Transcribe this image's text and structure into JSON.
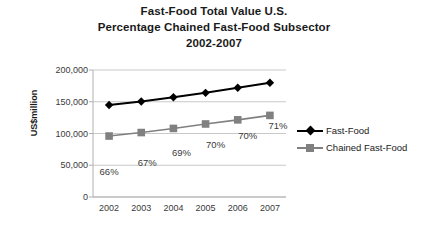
{
  "chart_data": {
    "type": "line",
    "title": "Fast-Food Total Value U.S. Percentage Chained Fast-Food Subsector 2002-2007",
    "title_lines": [
      "Fast-Food Total Value U.S.",
      "Percentage Chained Fast-Food Subsector",
      "2002-2007"
    ],
    "xlabel": "",
    "ylabel": "US$million",
    "categories": [
      "2002",
      "2003",
      "2004",
      "2005",
      "2006",
      "2007"
    ],
    "ylim": [
      0,
      200000
    ],
    "yticks": [
      0,
      50000,
      100000,
      150000,
      200000
    ],
    "ytick_labels": [
      "0",
      "50,000",
      "100,000",
      "150,000",
      "200,000"
    ],
    "grid": true,
    "legend_position": "right",
    "series": [
      {
        "name": "Fast-Food",
        "color": "#000000",
        "marker": "diamond",
        "values": [
          145000,
          150500,
          157000,
          164000,
          172000,
          180000
        ]
      },
      {
        "name": "Chained Fast-Food",
        "color": "#808080",
        "marker": "square",
        "values": [
          96000,
          101500,
          108000,
          115000,
          121500,
          128500
        ]
      }
    ],
    "annotations": [
      {
        "category": "2002",
        "text": "66%"
      },
      {
        "category": "2003",
        "text": "67%"
      },
      {
        "category": "2004",
        "text": "69%"
      },
      {
        "category": "2005",
        "text": "70%"
      },
      {
        "category": "2006",
        "text": "70%"
      },
      {
        "category": "2007",
        "text": "71%"
      }
    ],
    "annotation_offsets": [
      {
        "dx": 0,
        "dy": 30
      },
      {
        "dx": 6,
        "dy": 24
      },
      {
        "dx": 8,
        "dy": 19
      },
      {
        "dx": 10,
        "dy": 15
      },
      {
        "dx": 10,
        "dy": 10
      },
      {
        "dx": 8,
        "dy": 5
      }
    ],
    "colors": {
      "series_primary": "#000000",
      "series_secondary": "#808080",
      "gridline": "#c9c9c9",
      "axis": "#b0b0b0",
      "text": "#3a3a3a",
      "background": "#ffffff"
    }
  }
}
